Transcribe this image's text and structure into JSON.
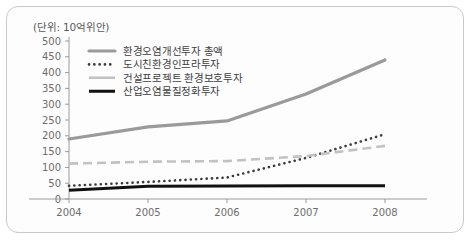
{
  "unit_label": "(단위: 10억위안)",
  "colors": {
    "total": "#9a9a9a",
    "urban": "#3b3b3b",
    "construction": "#c2c2c2",
    "industrial": "#111111",
    "axis": "#9b9b9b",
    "border": "#c9c9c9",
    "background": "#fdfdfd"
  },
  "legend": {
    "items": [
      {
        "label": "환경오염개선투자 총액",
        "style": "solid-thick",
        "color": "#9a9a9a"
      },
      {
        "label": "도시친환경인프라투자",
        "style": "dotted",
        "color": "#3b3b3b"
      },
      {
        "label": "건설프로젝트 환경보호투자",
        "style": "solid-light",
        "color": "#c2c2c2"
      },
      {
        "label": "산업오염물질정화투자",
        "style": "solid-black",
        "color": "#111111"
      }
    ]
  },
  "chart_data": {
    "type": "line",
    "title": "",
    "subtitle": "",
    "xlabel": "",
    "ylabel": "",
    "unit": "(단위: 10억위안)",
    "categories": [
      "2004",
      "2005",
      "2006",
      "2007",
      "2008"
    ],
    "x": [
      2004,
      2005,
      2006,
      2007,
      2008
    ],
    "ylim": [
      0,
      500
    ],
    "yticks": [
      0,
      50,
      100,
      150,
      200,
      250,
      300,
      350,
      400,
      450,
      500
    ],
    "ytick_labels": [
      "0",
      "50",
      "100",
      "150",
      "200",
      "250",
      "300",
      "350",
      "400",
      "450",
      "500"
    ],
    "grid": false,
    "legend_position": "inside-top-left",
    "series": [
      {
        "name": "환경오염개선투자 총액",
        "values": [
          190,
          228,
          247,
          332,
          440
        ],
        "color": "#9a9a9a",
        "style": "solid-thick"
      },
      {
        "name": "도시친환경인프라투자",
        "values": [
          42,
          54,
          68,
          130,
          205
        ],
        "color": "#3b3b3b",
        "style": "dotted"
      },
      {
        "name": "건설프로젝트 환경보호투자",
        "values": [
          112,
          118,
          120,
          136,
          168
        ],
        "color": "#c2c2c2",
        "style": "dashed"
      },
      {
        "name": "산업오염물질정화투자",
        "values": [
          28,
          40,
          41,
          42,
          42
        ],
        "color": "#111111",
        "style": "solid-black"
      }
    ]
  }
}
